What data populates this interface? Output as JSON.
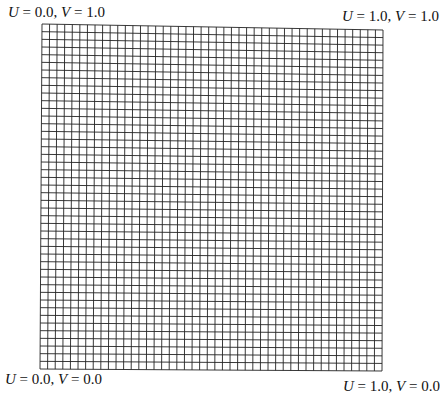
{
  "figure": {
    "type": "uv-parameter-grid",
    "grid": {
      "columns": 45,
      "rows": 45,
      "line_color": "#222222",
      "corners": {
        "top_left": [
          42,
          24
        ],
        "top_right": [
          383,
          30
        ],
        "bottom_left": [
          40,
          369
        ],
        "bottom_right": [
          382,
          371
        ]
      }
    },
    "labels": {
      "top_left": {
        "u_name": "U",
        "u_val": "0.0",
        "v_name": "V",
        "v_val": "1.0"
      },
      "top_right": {
        "u_name": "U",
        "u_val": "1.0",
        "v_name": "V",
        "v_val": "1.0"
      },
      "bottom_left": {
        "u_name": "U",
        "u_val": "0.0",
        "v_name": "V",
        "v_val": "0.0"
      },
      "bottom_right": {
        "u_name": "U",
        "u_val": "1.0",
        "v_name": "V",
        "v_val": "0.0"
      }
    },
    "symbols": {
      "eq": " = ",
      "sep": ", "
    }
  }
}
